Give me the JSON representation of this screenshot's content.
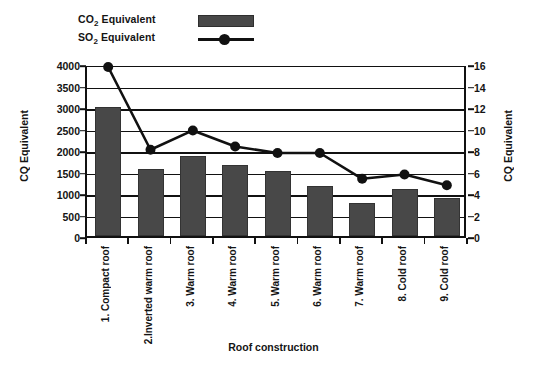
{
  "legend": {
    "items": [
      {
        "label_main": "CO",
        "label_sub": "2",
        "label_rest": " Equivalent",
        "key": "bar-swatch"
      },
      {
        "label_main": "SO",
        "label_sub": "2",
        "label_rest": " Equivalent",
        "key": "line-swatch"
      }
    ]
  },
  "axis": {
    "left_title": "CQ Equivalent",
    "right_title": "CQ Equivalent",
    "x_title": "Roof construction",
    "left_ticks": [
      "0",
      "500",
      "1000",
      "1500",
      "2000",
      "2500",
      "3000",
      "3500",
      "4000"
    ],
    "right_ticks": [
      "0",
      "2",
      "4",
      "6",
      "8",
      "10",
      "12",
      "14",
      "16"
    ]
  },
  "colors": {
    "bar_fill": "#484848",
    "bar_edge": "#333333",
    "line": "#111111",
    "axis": "#111111",
    "background": "#ffffff"
  },
  "chart_data": {
    "type": "bar",
    "title": "",
    "xlabel": "Roof construction",
    "ylabel": "CQ Equivalent",
    "categories": [
      "1. Compact roof",
      "2.Inverted warm roof",
      "3. Warm roof",
      "4. Warm roof",
      "5. Warm roof",
      "6. Warm roof",
      "7. Warm roof",
      "8. Cold roof",
      "9. Cold roof"
    ],
    "series": [
      {
        "name": "CO2 Equivalent",
        "type": "bar",
        "axis": "left",
        "values": [
          3000,
          1570,
          1850,
          1650,
          1520,
          1170,
          760,
          1100,
          880
        ]
      },
      {
        "name": "SO2 Equivalent",
        "type": "line",
        "axis": "right",
        "values": [
          16.0,
          8.3,
          10.1,
          8.6,
          8.0,
          8.0,
          5.6,
          6.0,
          5.0
        ]
      }
    ],
    "ylim": [
      0,
      4000
    ],
    "y2lim": [
      0,
      16
    ],
    "ytick_step": 500,
    "y2tick_step": 2,
    "grid": true,
    "legend_position": "top-left"
  }
}
